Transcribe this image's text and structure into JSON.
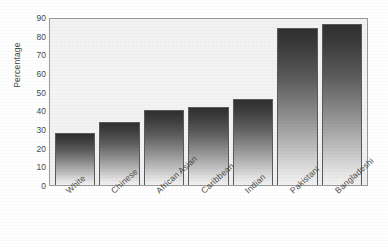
{
  "chart_data": {
    "type": "bar",
    "title": "",
    "xlabel": "",
    "ylabel": "Percentage",
    "categories": [
      "White",
      "Chinese",
      "African Asian",
      "Caribbean",
      "Indian",
      "Pakistani",
      "Bangladeshi"
    ],
    "values": [
      28,
      34,
      40,
      42,
      46,
      84,
      86
    ],
    "ylim": [
      0,
      90
    ],
    "yticks": [
      90,
      80,
      70,
      60,
      50,
      40,
      30,
      20,
      10,
      0
    ],
    "ytick_labels": [
      "90",
      "80",
      "70",
      "60",
      "50",
      "40",
      "30",
      "20",
      "10",
      "0"
    ],
    "grid": false,
    "legend": null,
    "legend_position": "none",
    "series": [
      {
        "name": "Percentage",
        "values": [
          28,
          34,
          40,
          42,
          46,
          84,
          86
        ]
      }
    ],
    "bar_style": {
      "fill": "vertical-gradient-dark-to-light",
      "top_color": "#303030",
      "bottom_color": "#f3f3f3",
      "border_color": "#5a5a5a"
    },
    "plot_background": "#f2f2f2",
    "axis_color": "#9a9a9a",
    "text_color": "#4a4a4a"
  }
}
